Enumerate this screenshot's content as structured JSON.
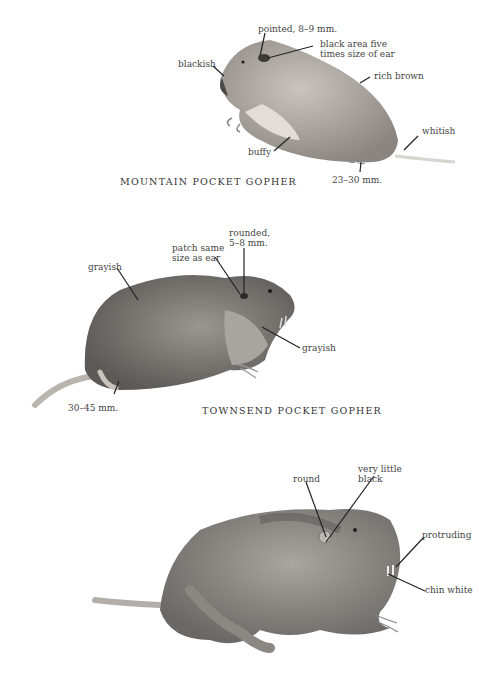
{
  "plate": {
    "animals": [
      {
        "name": "MOUNTAIN POCKET GOPHER",
        "labels": {
          "ear": "pointed, 8–9 mm.",
          "patch": "black area five\ntimes size of ear",
          "nose": "blackish",
          "back": "rich brown",
          "belly": "buffy",
          "tail": "whitish",
          "foot": "23–30 mm."
        }
      },
      {
        "name": "TOWNSEND POCKET GOPHER",
        "labels": {
          "ear": "rounded,\n5–8 mm.",
          "patch": "patch same\nsize as ear",
          "back": "grayish",
          "chest": "grayish",
          "foot": "30–45 mm."
        }
      },
      {
        "name": "",
        "labels": {
          "ear": "round",
          "patch": "very little\nblack",
          "teeth": "protruding",
          "chin": "chin white"
        }
      }
    ],
    "colors": {
      "background": "#ffffff",
      "fur_light": "#b9b4ae",
      "fur_mid": "#8e8a86",
      "fur_dark": "#5e5b58",
      "leader_line": "#222222"
    }
  }
}
